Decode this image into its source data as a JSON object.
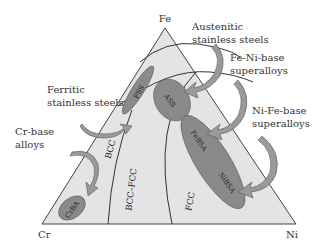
{
  "diagram": {
    "vertices": {
      "top": "Fe",
      "left": "Cr",
      "right": "Ni"
    },
    "regions": [
      "BCC",
      "BCC–FCC",
      "FCC"
    ],
    "alloy_groups": [
      {
        "abbr": "FSS",
        "name": "Ferritic stainless steels"
      },
      {
        "abbr": "ASS",
        "name": "Austenitic stainless steels"
      },
      {
        "abbr": "FeBSA",
        "name": "Fe-Ni-base superalloys"
      },
      {
        "abbr": "NiBSA",
        "name": "Ni-Fe-base superalloys"
      },
      {
        "abbr": "CrBA",
        "name": "Cr-base alloys"
      }
    ],
    "callouts": {
      "austenitic": [
        "Austenitic",
        "stainless steels"
      ],
      "feni": [
        "Fe-Ni-base",
        "superalloys"
      ],
      "nife": [
        "Ni-Fe-base",
        "superalloys"
      ],
      "ferritic": [
        "Ferritic",
        "stainless steels"
      ],
      "crbase": [
        "Cr-base",
        "alloys"
      ]
    },
    "colors": {
      "triangle_fill": "#e4e4e4",
      "oval_fill": "#8a8a8a",
      "arrow_fill": "#9a9a9a",
      "line": "#333333"
    }
  }
}
